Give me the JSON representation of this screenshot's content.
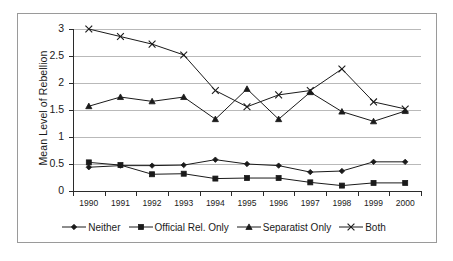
{
  "chart_data": {
    "type": "line",
    "title": "",
    "xlabel": "",
    "ylabel": "Mean Level of Rebellion",
    "x": [
      1990,
      1991,
      1992,
      1993,
      1994,
      1995,
      1996,
      1997,
      1998,
      1999,
      2000
    ],
    "categories": [
      "1990",
      "1991",
      "1992",
      "1993",
      "1994",
      "1995",
      "1996",
      "1997",
      "1998",
      "1999",
      "2000"
    ],
    "ylim": [
      0,
      3
    ],
    "yticks": [
      0,
      0.5,
      1,
      1.5,
      2,
      2.5,
      3
    ],
    "ytick_labels": [
      "0",
      "0.5",
      "1",
      "1.5",
      "2",
      "2.5",
      "3"
    ],
    "grid": true,
    "legend_position": "bottom",
    "series": [
      {
        "name": "Neither",
        "marker": "diamond",
        "values": [
          0.44,
          0.47,
          0.47,
          0.48,
          0.58,
          0.5,
          0.47,
          0.35,
          0.37,
          0.54,
          0.54
        ]
      },
      {
        "name": "Official Rel. Only",
        "marker": "square",
        "values": [
          0.53,
          0.48,
          0.31,
          0.32,
          0.23,
          0.24,
          0.24,
          0.16,
          0.1,
          0.15,
          0.15
        ]
      },
      {
        "name": "Separatist Only",
        "marker": "triangle",
        "values": [
          1.57,
          1.74,
          1.66,
          1.74,
          1.33,
          1.89,
          1.33,
          1.83,
          1.47,
          1.29,
          1.48
        ]
      },
      {
        "name": "Both",
        "marker": "x",
        "values": [
          3.0,
          2.86,
          2.72,
          2.52,
          1.86,
          1.56,
          1.78,
          1.86,
          2.26,
          1.65,
          1.52
        ]
      }
    ]
  },
  "legend": {
    "items": [
      {
        "label": "Neither",
        "marker": "diamond"
      },
      {
        "label": "Official Rel. Only",
        "marker": "square"
      },
      {
        "label": "Separatist Only",
        "marker": "triangle"
      },
      {
        "label": "Both",
        "marker": "x"
      }
    ]
  },
  "colors": {
    "line": "#1a1a1a",
    "grid": "#b9b9b9",
    "axis": "#2b2b2b",
    "border": "#9a9a9a",
    "background": "#ffffff"
  }
}
